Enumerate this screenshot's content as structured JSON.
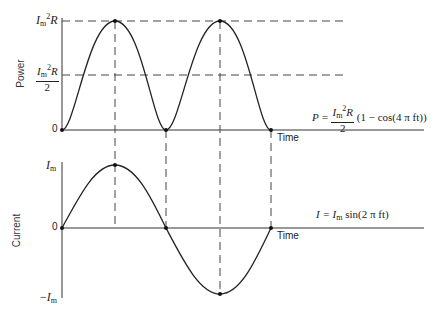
{
  "diagram": {
    "power_panel": {
      "ylabel": "Power",
      "xlabel": "Time",
      "yticks": {
        "top": {
          "base": "I",
          "sub": "m",
          "sup": "2",
          "tail": "R"
        },
        "half": {
          "num_base": "I",
          "num_sub": "m",
          "num_sup": "2",
          "num_tail": "R",
          "den": "2"
        },
        "zero": "0"
      },
      "equation": {
        "lhs": "P =",
        "num_base": "I",
        "num_sub": "m",
        "num_sup": "2",
        "num_tail": "R",
        "den": "2",
        "rhs": "(1 − cos(4 π ft))"
      }
    },
    "current_panel": {
      "ylabel": "Current",
      "xlabel": "Time",
      "yticks": {
        "top": {
          "base": "I",
          "sub": "m"
        },
        "zero": "0",
        "bottom": {
          "prefix": "−",
          "base": "I",
          "sub": "m"
        }
      },
      "equation": {
        "lhs": "I = ",
        "base": "I",
        "sub": "m",
        "rhs": " sin(2 π ft)"
      }
    },
    "colors": {
      "line": "#222222",
      "dash": "#444444",
      "axis": "#333333"
    }
  }
}
